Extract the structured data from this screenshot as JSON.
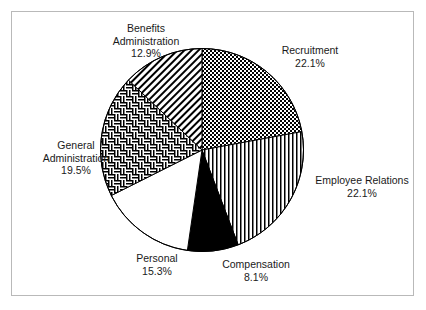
{
  "chart_data": {
    "type": "pie",
    "title": "",
    "subtitle": "",
    "legend_position": "none",
    "grid": false,
    "units": "percent",
    "start_angle_deg": 0,
    "direction": "clockwise",
    "categories": [
      "Recruitment",
      "Employee Relations",
      "Compensation",
      "Personal",
      "General Administration",
      "Benefits Administration"
    ],
    "values": [
      22.1,
      22.1,
      8.1,
      15.3,
      19.5,
      12.9
    ],
    "slices": [
      {
        "label": "Recruitment",
        "value": 22.1,
        "value_text": "22.1%",
        "fill": "checkerboard",
        "fill_color": "#000000",
        "background": "#ffffff"
      },
      {
        "label": "Employee Relations",
        "value": 22.1,
        "value_text": "22.1%",
        "fill": "vertical-stripes",
        "fill_color": "#000000",
        "background": "#ffffff"
      },
      {
        "label": "Compensation",
        "value": 8.1,
        "value_text": "8.1%",
        "fill": "solid",
        "fill_color": "#000000",
        "background": "#000000"
      },
      {
        "label": "Personal",
        "value": 15.3,
        "value_text": "15.3%",
        "fill": "none",
        "fill_color": "#000000",
        "background": "#ffffff"
      },
      {
        "label": "General Administration",
        "value": 19.5,
        "value_text": "19.5%",
        "fill": "basket-weave",
        "fill_color": "#000000",
        "background": "#ffffff"
      },
      {
        "label": "Benefits Administration",
        "value": 12.9,
        "value_text": "12.9%",
        "fill": "diagonal-hatch",
        "fill_color": "#000000",
        "background": "#ffffff"
      }
    ]
  },
  "labels": {
    "benefits": {
      "line1": "Benefits",
      "line2": "Administration",
      "value": "12.9%"
    },
    "recruitment": {
      "line1": "Recruitment",
      "value": "22.1%"
    },
    "employee": {
      "line1": "Employee Relations",
      "value": "22.1%"
    },
    "general": {
      "line1": "General",
      "line2": "Administration",
      "value": "19.5%"
    },
    "personal": {
      "line1": "Personal",
      "value": "15.3%"
    },
    "compensation": {
      "line1": "Compensation",
      "value": "8.1%"
    }
  },
  "style": {
    "frame_border_color": "#b9b9b9",
    "outline_color": "#000000",
    "text_color": "#1a1a1a",
    "page_background": "#ffffff"
  }
}
